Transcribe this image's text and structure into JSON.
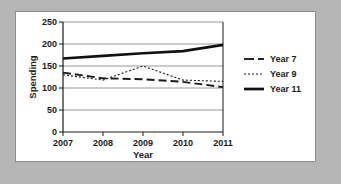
{
  "chart_data": {
    "type": "line",
    "title": "",
    "xlabel": "Year",
    "ylabel": "Spending",
    "x": [
      2007,
      2008,
      2009,
      2010,
      2011
    ],
    "xtick_labels": [
      "2007",
      "2008",
      "2009",
      "2010",
      "2011"
    ],
    "ytick_labels": [
      "0",
      "50",
      "100",
      "150",
      "200",
      "250"
    ],
    "yticks": [
      0,
      50,
      100,
      150,
      200,
      250
    ],
    "xlim": [
      2007,
      2011
    ],
    "ylim": [
      0,
      250
    ],
    "grid": "horizontal",
    "legend_position": "right",
    "series": [
      {
        "name": "Year 7",
        "style": "dashed",
        "values": [
          135,
          122,
          120,
          114,
          102
        ]
      },
      {
        "name": "Year 9",
        "style": "dotted",
        "values": [
          130,
          118,
          150,
          118,
          115
        ]
      },
      {
        "name": "Year 11",
        "style": "solid-thick",
        "values": [
          167,
          173,
          179,
          184,
          198
        ]
      }
    ],
    "colors": {
      "line": "#1a1a1a",
      "grid": "#9a9a9a",
      "axis": "#1a1a1a",
      "panel_background": "#ffffff",
      "page_background": "#b6b6b6"
    }
  }
}
